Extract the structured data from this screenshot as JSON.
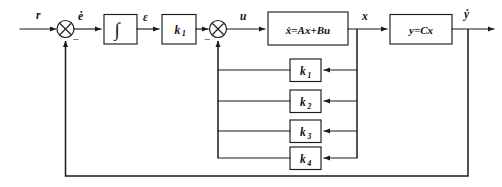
{
  "diagram": {
    "type": "control-block-diagram",
    "background_color": "#ffffff",
    "line_color": "#1a1a1a"
  },
  "signals": {
    "reference": "r",
    "error_rate": "ė",
    "error_integral": "ε",
    "control": "u",
    "state": "x",
    "output": "ẏ"
  },
  "blocks": {
    "integrator": {
      "label": "∫",
      "name": "integrator-block"
    },
    "forward_gain": {
      "label": "k",
      "subscript": "1",
      "name": "forward-gain-block"
    },
    "plant": {
      "label": "ẋ=Ax+Bu",
      "lhs": "ẋ",
      "eq": "=",
      "rhs": "Ax+Bu",
      "name": "plant-state-equation-block"
    },
    "output_eq": {
      "label": "y=Cx",
      "lhs": "y",
      "eq": "=",
      "rhs": "Cx",
      "name": "output-equation-block"
    }
  },
  "feedback_gains": [
    {
      "label": "k",
      "subscript": "1",
      "name": "feedback-gain-k1"
    },
    {
      "label": "k",
      "subscript": "2",
      "name": "feedback-gain-k2"
    },
    {
      "label": "k",
      "subscript": "3",
      "name": "feedback-gain-k3"
    },
    {
      "label": "k",
      "subscript": "4",
      "name": "feedback-gain-k4"
    }
  ],
  "summing_junctions": [
    {
      "name": "summing-junction-1",
      "negative_sign": "−"
    },
    {
      "name": "summing-junction-2",
      "negative_sign": "−"
    }
  ]
}
